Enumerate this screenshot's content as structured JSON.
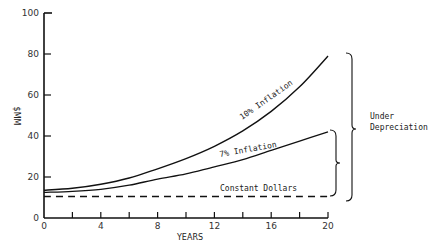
{
  "chart_data": {
    "type": "line",
    "title": "",
    "xlabel": "YEARS",
    "ylabel": "$MM",
    "xlim": [
      0,
      20
    ],
    "ylim": [
      0,
      100
    ],
    "x_ticks": [
      0,
      4,
      8,
      12,
      16,
      20
    ],
    "x_minor_ticks": [
      2,
      6,
      10,
      14,
      18
    ],
    "y_ticks": [
      0,
      20,
      40,
      60,
      80,
      100
    ],
    "grid": false,
    "x": [
      0,
      2,
      4,
      6,
      8,
      10,
      12,
      14,
      16,
      18,
      20
    ],
    "series": [
      {
        "name": "10% Inflation",
        "style": "solid",
        "values": [
          13.5,
          14.5,
          16.5,
          19.5,
          24,
          29,
          35,
          42.5,
          52,
          64,
          79
        ]
      },
      {
        "name": "7% Inflation",
        "style": "solid",
        "values": [
          12.5,
          13,
          14,
          16,
          19,
          21.5,
          25,
          28.5,
          33,
          37.5,
          42
        ]
      },
      {
        "name": "Constant Dollars",
        "style": "dashed",
        "values": [
          10.5,
          10.5,
          10.5,
          10.5,
          10.5,
          10.5,
          10.5,
          10.5,
          10.5,
          10.5,
          10.5
        ]
      }
    ],
    "annotations": [
      {
        "text": "10% Inflation",
        "attached_to": "10% Inflation"
      },
      {
        "text": "7% Inflation",
        "attached_to": "7% Inflation"
      },
      {
        "text": "Constant Dollars",
        "attached_to": "Constant Dollars"
      },
      {
        "text": "Under Depreciation",
        "type": "brace",
        "spans": [
          "Constant Dollars",
          "10% Inflation"
        ]
      },
      {
        "type": "brace",
        "spans": [
          "Constant Dollars",
          "7% Inflation"
        ]
      }
    ]
  },
  "labels": {
    "y_axis": "$MM",
    "x_axis": "YEARS",
    "x_ticks": [
      "0",
      "4",
      "8",
      "12",
      "16",
      "20"
    ],
    "y_ticks": [
      "0",
      "20",
      "40",
      "60",
      "80",
      "100"
    ],
    "series_10": "10% Inflation",
    "series_7": "7% Inflation",
    "series_const": "Constant Dollars",
    "brace_line1": "Under",
    "brace_line2": "Depreciation"
  }
}
